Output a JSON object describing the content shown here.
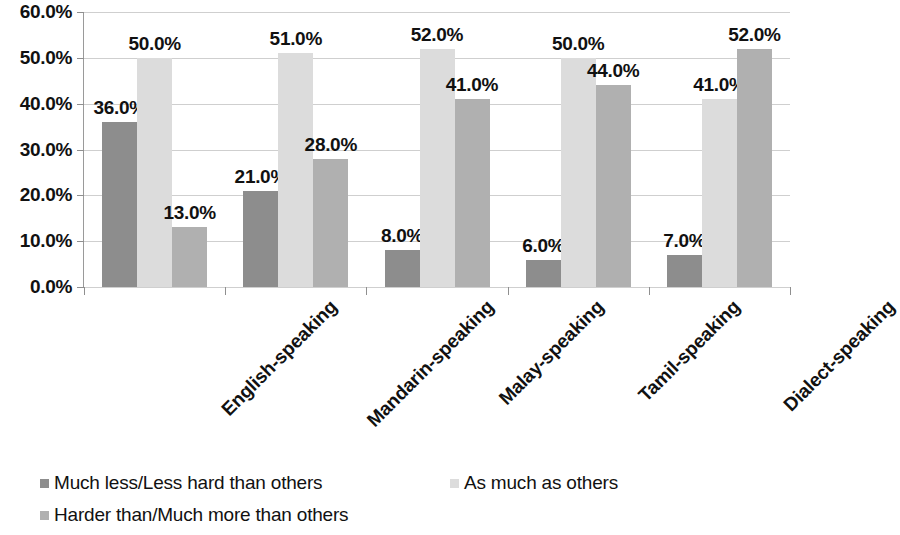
{
  "chart_data": {
    "type": "bar",
    "title": "",
    "subtitle": "",
    "xlabel": "",
    "ylabel": "",
    "grid": true,
    "legend_position": "bottom-left",
    "ylim": [
      0,
      60
    ],
    "ytick_step": 10,
    "ytick_labels": [
      "60.0%",
      "50.0%",
      "40.0%",
      "30.0%",
      "20.0%",
      "10.0%",
      "0.0%"
    ],
    "ytick_values": [
      60,
      50,
      40,
      30,
      20,
      10,
      0
    ],
    "categories": [
      "English-speaking",
      "Mandarin-speaking",
      "Malay-speaking",
      "Tamil-speaking",
      "Dialect-speaking"
    ],
    "series": [
      {
        "name": "Much less/Less hard than others",
        "color": "#8d8d8d",
        "values": [
          36.0,
          21.0,
          8.0,
          6.0,
          7.0
        ],
        "labels": [
          "36.0%",
          "21.0%",
          "8.0%",
          "6.0%",
          "7.0%"
        ]
      },
      {
        "name": "As much as others",
        "color": "#dcdcdc",
        "values": [
          50.0,
          51.0,
          52.0,
          50.0,
          41.0
        ],
        "labels": [
          "50.0%",
          "51.0%",
          "52.0%",
          "50.0%",
          "41.0%"
        ]
      },
      {
        "name": "Harder than/Much more than others",
        "color": "#b0b0b0",
        "values": [
          13.0,
          28.0,
          41.0,
          44.0,
          52.0
        ],
        "labels": [
          "13.0%",
          "28.0%",
          "41.0%",
          "44.0%",
          "52.0%"
        ]
      }
    ]
  }
}
